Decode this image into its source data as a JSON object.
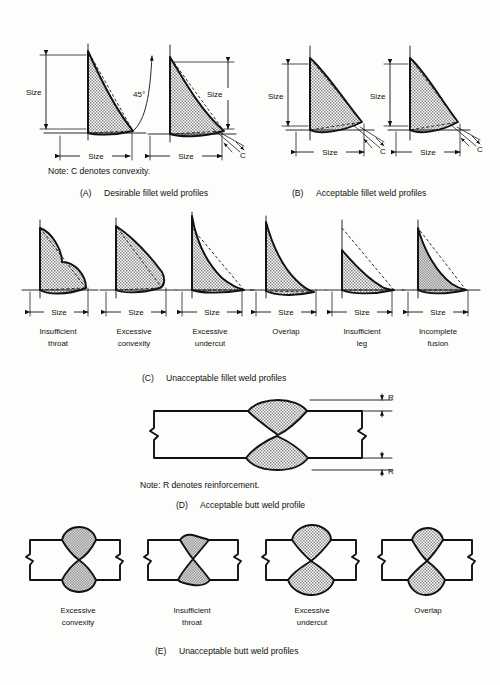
{
  "figure": {
    "background_color": "#fdfdfb",
    "ink_color": "#111111",
    "fill_pattern": "stipple-checker-gray"
  },
  "sections": {
    "a": {
      "caption_tag": "(A)",
      "caption_text": "Desirable fillet weld profiles",
      "note": "Note:   C denotes convexity.",
      "angle_label": "45°",
      "profiles": [
        {
          "name": "concave-fillet",
          "size_vertical": "Size",
          "size_horizontal": "Size"
        },
        {
          "name": "flat-fillet",
          "size_vertical": "Size",
          "size_horizontal": "Size",
          "convexity_label": "C"
        }
      ]
    },
    "b": {
      "caption_tag": "(B)",
      "caption_text": "Acceptable fillet weld profiles",
      "profiles": [
        {
          "name": "convex-fillet-left",
          "size_vertical": "Size",
          "size_horizontal": "Size",
          "convexity_label": "C"
        },
        {
          "name": "convex-fillet-right",
          "size_vertical": "Size",
          "size_horizontal": "Size",
          "convexity_label": "C"
        }
      ]
    },
    "c": {
      "caption_tag": "(C)",
      "caption_text": "Unacceptable fillet weld profiles",
      "size_label": "Size",
      "profiles": [
        {
          "name": "insufficient-throat",
          "label_line1": "Insufficient",
          "label_line2": "throat"
        },
        {
          "name": "excessive-convexity",
          "label_line1": "Excessive",
          "label_line2": "convexity"
        },
        {
          "name": "excessive-undercut",
          "label_line1": "Excessive",
          "label_line2": "undercut"
        },
        {
          "name": "overlap",
          "label_line1": "Overlap",
          "label_line2": ""
        },
        {
          "name": "insufficient-leg",
          "label_line1": "Insufficient",
          "label_line2": "leg"
        },
        {
          "name": "incomplete-fusion",
          "label_line1": "Incomplete",
          "label_line2": "fusion"
        }
      ]
    },
    "d": {
      "caption_tag": "(D)",
      "caption_text": "Acceptable butt weld profile",
      "note": "Note:   R denotes reinforcement.",
      "reinforcement_label_top": "R",
      "reinforcement_label_bottom": "R"
    },
    "e": {
      "caption_tag": "(E)",
      "caption_text": "Unacceptable butt weld profiles",
      "profiles": [
        {
          "name": "excessive-convexity-butt",
          "label_line1": "Excessive",
          "label_line2": "convexity"
        },
        {
          "name": "insufficient-throat-butt",
          "label_line1": "Insufficient",
          "label_line2": "throat"
        },
        {
          "name": "excessive-undercut-butt",
          "label_line1": "Excessive",
          "label_line2": "undercut"
        },
        {
          "name": "overlap-butt",
          "label_line1": "Overlap",
          "label_line2": ""
        }
      ]
    }
  }
}
